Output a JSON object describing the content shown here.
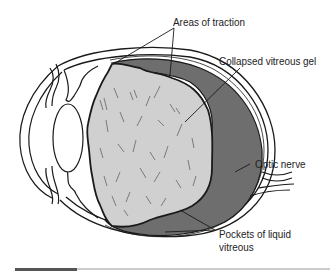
{
  "diagram": {
    "type": "anatomical-cross-section",
    "labels": {
      "traction": "Areas of traction",
      "collapsed_gel": "Collapsed vitreous gel",
      "optic_nerve": "Optic nerve",
      "pockets_line1": "Pockets of liquid",
      "pockets_line2": "vitreous"
    },
    "colors": {
      "outline": "#1a1a1a",
      "vitreous_gel": "#d0d0d0",
      "liquid_pocket": "#6e6e6e",
      "background": "#ffffff"
    }
  }
}
